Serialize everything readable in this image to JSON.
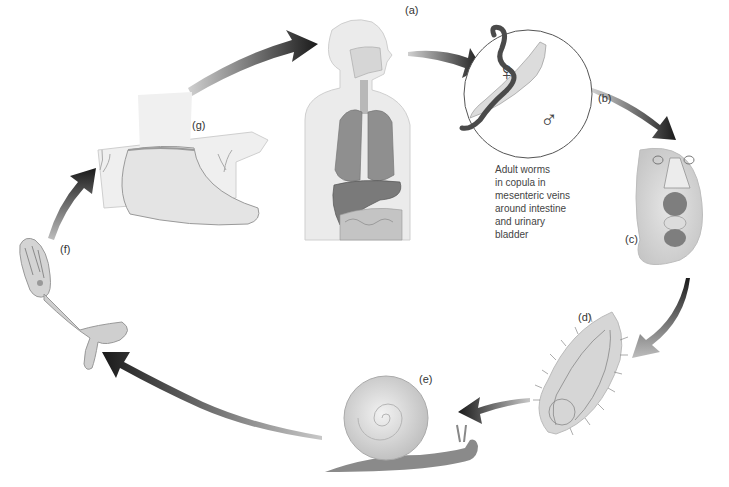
{
  "diagram": {
    "stages": [
      {
        "id": "a",
        "label": "(a)",
        "depicts": "human host (thorax and abdomen)"
      },
      {
        "id": "b",
        "label": "(b)",
        "depicts": "adult worms, female and male",
        "symbols": [
          "♀",
          "♂"
        ]
      },
      {
        "id": "c",
        "label": "(c)",
        "depicts": "egg"
      },
      {
        "id": "d",
        "label": "(d)",
        "depicts": "miracidium"
      },
      {
        "id": "e",
        "label": "(e)",
        "depicts": "snail intermediate host"
      },
      {
        "id": "f",
        "label": "(f)",
        "depicts": "cercaria"
      },
      {
        "id": "g",
        "label": "(g)",
        "depicts": "foot in water (skin penetration)"
      }
    ],
    "caption_lines": [
      "Adult worms",
      "in copula in",
      "mesenteric veins",
      "around intestine",
      "and urinary",
      "bladder"
    ],
    "flow": [
      "g",
      "a",
      "b",
      "c",
      "d",
      "e",
      "f",
      "g"
    ],
    "colors": {
      "arrow_dark": "#1e1e1e",
      "arrow_light": "#9a9a9a",
      "tissue": "#dcdcdc",
      "organ": "#8c8c8c"
    }
  }
}
